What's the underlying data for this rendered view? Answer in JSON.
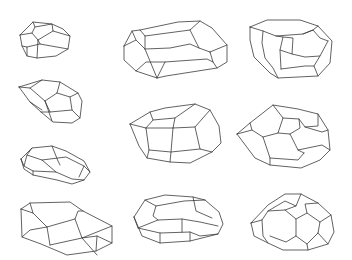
{
  "figure": {
    "background": "#ffffff",
    "stroke_color": "#3a3a3a",
    "layout": "3 columns of polyhedral line drawings (4 in left column, 3 in middle, 3 in right plus none)",
    "shapes": [
      {
        "name": "polyhedron-1",
        "position": "left column, row 1",
        "paths": [
          "20,35 33,22 52,24 63,29 70,36 68,49 56,56 37,58 27,56 22,46 20,35",
          "20,35 32,33 38,40 37,58",
          "32,33 35,27 33,22",
          "35,27 52,24 53,31 70,36",
          "38,40 53,31",
          "38,40 40,44 68,49",
          "27,56 27,47 22,46",
          "27,47 40,44"
        ]
      },
      {
        "name": "polyhedron-2",
        "position": "left column, row 2",
        "paths": [
          "19,87 42,80 60,82 78,93 82,101 80,118 72,123 53,122 41,112 30,102 19,87",
          "19,87 30,88 45,101 52,121",
          "30,88 42,80",
          "45,101 57,93 60,82",
          "57,93 70,97 78,93",
          "70,97 72,110 80,118",
          "45,101 50,112 72,110",
          "41,112 50,112",
          "30,102 42,110"
        ]
      },
      {
        "name": "polyhedron-3",
        "position": "left column, row 3",
        "paths": [
          "21,159 32,148 52,146 66,151 84,161 90,172 84,180 72,184 57,180 33,175 24,169 21,159",
          "21,159 24,166 33,171 56,172 72,179 84,180",
          "24,166 27,155 32,148",
          "27,155 42,160 56,172",
          "42,160 66,157 84,166 90,172",
          "52,146 58,161 60,165",
          "84,166 79,177",
          "33,171 33,175"
        ]
      },
      {
        "name": "polyhedron-4",
        "position": "left column, row 4",
        "paths": [
          "21,209 30,203 70,202 83,211 112,226 112,243 96,251 67,255 41,244 22,237 21,209",
          "21,209 33,213 47,227 50,245",
          "30,203 33,213",
          "47,227 75,219 78,211 83,211",
          "75,219 82,238 112,226",
          "50,245 82,238 97,236 112,243",
          "82,238 97,255",
          "97,236 96,251",
          "22,237 30,230 47,227"
        ]
      },
      {
        "name": "polyhedron-5",
        "position": "middle column, row 1",
        "paths": [
          "124,46 132,31 140,30 178,22 200,21 212,28 227,45 227,62 217,68 166,76 157,78 136,71 124,60 124,46",
          "124,46 136,40 145,49 157,78",
          "132,31 136,40",
          "140,30 145,36 190,30 200,21",
          "145,36 145,49",
          "145,49 170,48 190,44 199,48 210,52",
          "190,30 199,48",
          "210,52 227,45",
          "210,52 213,62 217,68",
          "157,78 165,62 207,59 213,62",
          "136,71 146,62 165,62"
        ]
      },
      {
        "name": "polyhedron-6",
        "position": "middle column, row 2",
        "paths": [
          "130,124 150,112 165,108 195,104 210,110 219,126 221,143 212,152 190,163 170,162 147,158 139,146 130,124",
          "130,124 146,128 149,150 147,158",
          "150,112 153,120 175,118 195,104",
          "153,120 146,128",
          "175,118 173,128 195,127 210,110",
          "173,128 171,152 170,162",
          "195,127 200,149 212,152",
          "146,128 173,128",
          "149,150 171,152 200,149"
        ]
      },
      {
        "name": "polyhedron-7",
        "position": "middle column, row 3",
        "paths": [
          "134,217 145,200 165,195 193,197 205,200 219,212 223,224 218,234 190,241 160,243 142,236 134,217",
          "134,217 138,228 160,233 190,232 200,236 218,234",
          "138,228 158,220 182,219 200,222 218,226",
          "145,200 156,206 184,201 205,200",
          "156,206 153,216 158,220",
          "182,219 182,232",
          "193,197 196,211 212,218",
          "160,233 160,243",
          "190,232 190,241"
        ]
      },
      {
        "name": "polyhedron-8",
        "position": "right column, row 1",
        "paths": [
          "250,27 267,20 300,20 318,26 332,41 330,63 318,76 278,78 270,73 254,57 250,40 250,27",
          "250,27 263,31 276,36 303,34 313,30 318,26",
          "263,31 262,43 265,58 273,68 278,78",
          "276,36 283,37 280,50 281,69",
          "283,37 293,38 292,54 305,57 320,56 328,41",
          "280,50 292,54",
          "281,69 305,66 314,66 318,76",
          "314,66 320,56",
          "303,34 313,30 320,38 328,41"
        ]
      },
      {
        "name": "polyhedron-9",
        "position": "right column, row 2",
        "paths": [
          "237,134 250,123 273,105 298,109 318,114 328,130 330,150 320,160 301,168 270,165 255,158 237,134",
          "237,134 252,130 263,137 270,158 270,165",
          "252,130 250,123",
          "263,137 278,133 283,118 273,105",
          "283,118 299,119 305,127 318,126 318,114",
          "278,133 290,134 298,150 304,153",
          "299,119 300,128 290,134",
          "305,127 322,132 328,130",
          "298,150 322,145 330,150",
          "270,158 298,160 304,153"
        ]
      },
      {
        "name": "polyhedron-10",
        "position": "right column, row 3",
        "paths": [
          "251,223 268,205 285,194 301,194 318,203 331,215 334,232 328,244 308,250 283,250 268,243 254,236 251,223",
          "251,223 262,220 268,211 285,201 296,206 301,194",
          "262,220 263,236 268,243",
          "268,211 285,210 296,206",
          "285,210 296,219 296,236 286,242 270,236",
          "296,219 307,213 320,222 318,233 307,244",
          "296,236 307,244 308,250",
          "307,213 305,204 318,203",
          "320,222 331,215",
          "318,233 328,244"
        ]
      }
    ]
  }
}
